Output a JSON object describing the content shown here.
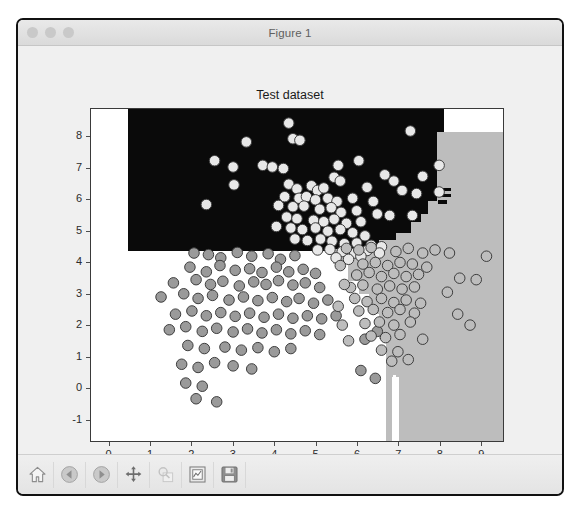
{
  "window": {
    "title": "Figure 1",
    "traffic_lights": [
      "close-button",
      "minimize-button",
      "maximize-button"
    ]
  },
  "toolbar": {
    "buttons": [
      {
        "name": "home-button",
        "label": "Home",
        "icon": "home-icon",
        "disabled": false
      },
      {
        "name": "back-button",
        "label": "Back",
        "icon": "back-arrow-icon",
        "disabled": false
      },
      {
        "name": "forward-button",
        "label": "Forward",
        "icon": "forward-arrow-icon",
        "disabled": false
      },
      {
        "name": "pan-button",
        "label": "Pan",
        "icon": "move-icon",
        "disabled": false
      },
      {
        "name": "zoom-button",
        "label": "Zoom to rectangle",
        "icon": "magnifier-icon",
        "disabled": true
      },
      {
        "name": "subplots-button",
        "label": "Configure subplots",
        "icon": "subplots-icon",
        "disabled": false
      },
      {
        "name": "save-button",
        "label": "Save the figure",
        "icon": "floppy-disk-icon",
        "disabled": false
      }
    ]
  },
  "chart_data": {
    "type": "scatter",
    "title": "Test dataset",
    "xlabel": "",
    "ylabel": "",
    "xlim": [
      -0.45,
      9.55
    ],
    "ylim": [
      -1.7,
      8.9
    ],
    "xticks": [
      0,
      1,
      2,
      3,
      4,
      5,
      6,
      7,
      8,
      9
    ],
    "yticks": [
      -1,
      0,
      1,
      2,
      3,
      4,
      5,
      6,
      7,
      8
    ],
    "grid": false,
    "legend": null,
    "colors": {
      "region_class_0": "#0a0a0a",
      "region_class_1": "#ffffff",
      "region_class_2": "#bdbdbd",
      "point_dark_fill": "#9a9a9a",
      "point_light_fill": "#e8e8e8",
      "point_edge": "#3c3c3c",
      "figure_background": "#f0f0f0",
      "axes_background": "#ffffff",
      "axis_line": "#3a3a3a"
    },
    "decision_regions": [
      {
        "label": "class-0-region",
        "color": "#0a0a0a",
        "area": "upper band, y above ~4.4, x from ~0.45 to ~8.1 with stair-step right edge"
      },
      {
        "label": "class-1-region",
        "color": "#ffffff",
        "area": "lower-left band, y below ~4.4, x from 0 to ~6.7"
      },
      {
        "label": "class-2-region",
        "color": "#bdbdbd",
        "area": "right band, x above ~5.3 stepping down, full height below y~8.15"
      }
    ],
    "series": [
      {
        "name": "class-light",
        "marker": "o",
        "fill": "#e8e8e8",
        "edge": "#3c3c3c",
        "points": [
          [
            4.35,
            8.45
          ],
          [
            7.3,
            8.2
          ],
          [
            3.32,
            7.85
          ],
          [
            4.45,
            7.95
          ],
          [
            4.62,
            7.9
          ],
          [
            2.55,
            7.25
          ],
          [
            5.55,
            7.1
          ],
          [
            6.05,
            7.25
          ],
          [
            3.0,
            7.05
          ],
          [
            3.72,
            7.1
          ],
          [
            3.95,
            7.05
          ],
          [
            4.22,
            7.0
          ],
          [
            8.0,
            7.1
          ],
          [
            5.45,
            6.72
          ],
          [
            5.6,
            6.6
          ],
          [
            6.68,
            6.8
          ],
          [
            6.9,
            6.6
          ],
          [
            7.6,
            6.75
          ],
          [
            3.02,
            6.48
          ],
          [
            4.35,
            6.5
          ],
          [
            4.55,
            6.35
          ],
          [
            4.9,
            6.45
          ],
          [
            5.05,
            6.3
          ],
          [
            5.2,
            6.38
          ],
          [
            6.25,
            6.4
          ],
          [
            7.1,
            6.3
          ],
          [
            7.45,
            6.2
          ],
          [
            8.0,
            6.25
          ],
          [
            4.25,
            6.1
          ],
          [
            4.6,
            6.05
          ],
          [
            4.78,
            6.1
          ],
          [
            5.0,
            6.0
          ],
          [
            5.3,
            6.05
          ],
          [
            5.52,
            5.95
          ],
          [
            5.9,
            6.05
          ],
          [
            6.4,
            5.95
          ],
          [
            2.35,
            5.85
          ],
          [
            4.1,
            5.82
          ],
          [
            4.45,
            5.78
          ],
          [
            4.72,
            5.8
          ],
          [
            5.1,
            5.7
          ],
          [
            5.38,
            5.75
          ],
          [
            5.62,
            5.6
          ],
          [
            6.0,
            5.65
          ],
          [
            6.5,
            5.55
          ],
          [
            6.8,
            5.5
          ],
          [
            7.35,
            5.5
          ],
          [
            4.3,
            5.45
          ],
          [
            4.55,
            5.4
          ],
          [
            4.95,
            5.35
          ],
          [
            5.2,
            5.3
          ],
          [
            5.45,
            5.38
          ],
          [
            5.75,
            5.25
          ],
          [
            6.1,
            5.3
          ],
          [
            4.05,
            5.15
          ],
          [
            4.4,
            5.1
          ],
          [
            4.68,
            5.05
          ],
          [
            5.0,
            5.1
          ],
          [
            5.3,
            5.0
          ],
          [
            5.6,
            5.05
          ],
          [
            5.9,
            4.95
          ],
          [
            6.2,
            4.85
          ],
          [
            4.5,
            4.75
          ],
          [
            4.8,
            4.7
          ],
          [
            5.12,
            4.75
          ],
          [
            5.4,
            4.68
          ],
          [
            5.7,
            4.6
          ],
          [
            6.0,
            4.62
          ],
          [
            6.35,
            4.55
          ],
          [
            6.6,
            4.5
          ],
          [
            5.05,
            4.4
          ],
          [
            5.35,
            4.42
          ],
          [
            5.65,
            4.35
          ],
          [
            5.95,
            4.3
          ],
          [
            6.25,
            4.38
          ],
          [
            6.55,
            4.3
          ],
          [
            5.5,
            4.15
          ],
          [
            5.8,
            4.1
          ],
          [
            6.1,
            4.2
          ]
        ]
      },
      {
        "name": "class-dark",
        "marker": "o",
        "fill": "#9a9a9a",
        "edge": "#3c3c3c",
        "points": [
          [
            2.05,
            4.3
          ],
          [
            2.4,
            4.25
          ],
          [
            2.7,
            4.15
          ],
          [
            3.1,
            4.32
          ],
          [
            3.45,
            4.2
          ],
          [
            3.85,
            4.28
          ],
          [
            4.15,
            4.1
          ],
          [
            4.5,
            4.22
          ],
          [
            1.95,
            3.85
          ],
          [
            2.35,
            3.7
          ],
          [
            2.68,
            3.9
          ],
          [
            3.05,
            3.75
          ],
          [
            3.4,
            3.8
          ],
          [
            3.7,
            3.68
          ],
          [
            4.05,
            3.85
          ],
          [
            4.35,
            3.7
          ],
          [
            4.7,
            3.78
          ],
          [
            5.0,
            3.65
          ],
          [
            1.55,
            3.35
          ],
          [
            2.1,
            3.45
          ],
          [
            2.45,
            3.3
          ],
          [
            2.75,
            3.4
          ],
          [
            3.15,
            3.25
          ],
          [
            3.5,
            3.38
          ],
          [
            3.8,
            3.3
          ],
          [
            4.1,
            3.42
          ],
          [
            4.45,
            3.28
          ],
          [
            4.75,
            3.35
          ],
          [
            5.1,
            3.2
          ],
          [
            1.25,
            2.9
          ],
          [
            1.8,
            3.0
          ],
          [
            2.15,
            2.85
          ],
          [
            2.5,
            2.95
          ],
          [
            2.9,
            2.8
          ],
          [
            3.25,
            2.9
          ],
          [
            3.6,
            2.78
          ],
          [
            3.95,
            2.88
          ],
          [
            4.3,
            2.75
          ],
          [
            4.6,
            2.85
          ],
          [
            4.95,
            2.7
          ],
          [
            5.3,
            2.8
          ],
          [
            1.6,
            2.35
          ],
          [
            2.0,
            2.45
          ],
          [
            2.35,
            2.3
          ],
          [
            2.7,
            2.4
          ],
          [
            3.05,
            2.28
          ],
          [
            3.4,
            2.38
          ],
          [
            3.75,
            2.25
          ],
          [
            4.1,
            2.35
          ],
          [
            4.45,
            2.22
          ],
          [
            4.8,
            2.3
          ],
          [
            5.15,
            2.2
          ],
          [
            5.5,
            2.3
          ],
          [
            1.45,
            1.85
          ],
          [
            1.85,
            1.95
          ],
          [
            2.25,
            1.8
          ],
          [
            2.6,
            1.9
          ],
          [
            3.0,
            1.78
          ],
          [
            3.35,
            1.88
          ],
          [
            3.7,
            1.75
          ],
          [
            4.05,
            1.85
          ],
          [
            4.4,
            1.72
          ],
          [
            4.75,
            1.82
          ],
          [
            5.1,
            1.7
          ],
          [
            6.2,
            1.55
          ],
          [
            6.5,
            1.8
          ],
          [
            1.9,
            1.35
          ],
          [
            2.3,
            1.25
          ],
          [
            2.8,
            1.3
          ],
          [
            3.2,
            1.2
          ],
          [
            3.6,
            1.28
          ],
          [
            4.0,
            1.15
          ],
          [
            4.4,
            1.25
          ],
          [
            1.75,
            0.75
          ],
          [
            2.15,
            0.65
          ],
          [
            2.55,
            0.8
          ],
          [
            3.0,
            0.7
          ],
          [
            3.45,
            0.6
          ],
          [
            6.1,
            0.55
          ],
          [
            1.85,
            0.15
          ],
          [
            2.25,
            0.05
          ],
          [
            2.1,
            -0.35
          ],
          [
            2.6,
            -0.45
          ],
          [
            6.45,
            0.3
          ]
        ]
      },
      {
        "name": "class-outline",
        "marker": "o",
        "fill": "#bdbdbd",
        "edge": "#3c3c3c",
        "points": [
          [
            5.75,
            4.45
          ],
          [
            6.05,
            4.4
          ],
          [
            6.35,
            4.48
          ],
          [
            6.95,
            4.35
          ],
          [
            7.25,
            4.45
          ],
          [
            7.6,
            4.3
          ],
          [
            7.9,
            4.4
          ],
          [
            8.25,
            4.3
          ],
          [
            9.15,
            4.2
          ],
          [
            6.15,
            3.95
          ],
          [
            6.45,
            4.0
          ],
          [
            6.75,
            3.9
          ],
          [
            7.05,
            4.0
          ],
          [
            7.35,
            3.95
          ],
          [
            7.7,
            3.85
          ],
          [
            6.0,
            3.6
          ],
          [
            6.3,
            3.68
          ],
          [
            6.6,
            3.55
          ],
          [
            6.9,
            3.65
          ],
          [
            7.2,
            3.55
          ],
          [
            7.5,
            3.62
          ],
          [
            8.5,
            3.5
          ],
          [
            8.9,
            3.45
          ],
          [
            5.85,
            3.2
          ],
          [
            6.15,
            3.28
          ],
          [
            6.5,
            3.15
          ],
          [
            6.8,
            3.25
          ],
          [
            7.1,
            3.15
          ],
          [
            7.4,
            3.22
          ],
          [
            8.2,
            3.05
          ],
          [
            5.95,
            2.85
          ],
          [
            6.25,
            2.75
          ],
          [
            6.6,
            2.85
          ],
          [
            6.9,
            2.72
          ],
          [
            7.2,
            2.8
          ],
          [
            7.55,
            2.7
          ],
          [
            6.05,
            2.45
          ],
          [
            6.4,
            2.5
          ],
          [
            6.75,
            2.4
          ],
          [
            7.05,
            2.5
          ],
          [
            7.4,
            2.38
          ],
          [
            8.45,
            2.35
          ],
          [
            6.2,
            2.05
          ],
          [
            6.55,
            2.1
          ],
          [
            6.9,
            2.0
          ],
          [
            7.3,
            2.1
          ],
          [
            8.75,
            2.0
          ],
          [
            6.35,
            1.65
          ],
          [
            6.7,
            1.6
          ],
          [
            7.05,
            1.7
          ],
          [
            7.6,
            1.55
          ],
          [
            6.6,
            1.2
          ],
          [
            7.0,
            1.15
          ],
          [
            6.85,
            0.85
          ],
          [
            7.25,
            0.9
          ],
          [
            5.6,
            3.9
          ],
          [
            5.7,
            3.3
          ],
          [
            5.55,
            2.6
          ],
          [
            5.65,
            2.0
          ],
          [
            5.8,
            1.5
          ]
        ]
      }
    ]
  }
}
